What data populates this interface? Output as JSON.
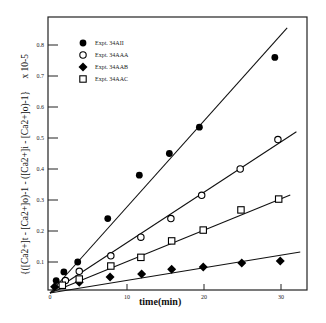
{
  "chart_data": {
    "type": "scatter",
    "title": "",
    "xlabel": "time(min)",
    "ylabel": "{([Ca2+]t - [Ca2+]o)-1 - ([Ca2+]i - [Ca2+]o)-1}",
    "ylabel_scale": "x 10-5",
    "xlim": [
      0,
      33.5
    ],
    "ylim": [
      0,
      0.88
    ],
    "x_ticks": [
      0,
      10,
      20,
      30
    ],
    "x_tick_labels": [
      "0",
      "10",
      "20",
      "30"
    ],
    "y_ticks": [
      0.1,
      0.2,
      0.3,
      0.4,
      0.5,
      0.6,
      0.7,
      0.8
    ],
    "y_tick_labels": [
      "0.1",
      "0.2",
      "0.3",
      "0.4",
      "0.5",
      "0.6",
      "0.7",
      "0.8"
    ],
    "grid": false,
    "legend_position": "top-left",
    "series": [
      {
        "name": "Expt. 34AII",
        "marker": "filled-circle",
        "x": [
          0.8,
          1.8,
          3.6,
          7.5,
          11.6,
          15.5,
          19.4,
          29.2
        ],
        "y": [
          0.04,
          0.068,
          0.1,
          0.24,
          0.38,
          0.45,
          0.535,
          0.76
        ],
        "fit_line": {
          "x": [
            0,
            30.8
          ],
          "y": [
            0,
            0.855
          ]
        }
      },
      {
        "name": "Expt. 34AAA",
        "marker": "open-circle",
        "x": [
          2.0,
          3.8,
          7.9,
          11.8,
          15.7,
          19.7,
          24.7,
          29.6
        ],
        "y": [
          0.04,
          0.07,
          0.12,
          0.18,
          0.24,
          0.315,
          0.4,
          0.495
        ],
        "fit_line": {
          "x": [
            0,
            32.0
          ],
          "y": [
            0,
            0.52
          ]
        }
      },
      {
        "name": "Expt. 34AAB",
        "marker": "filled-diamond",
        "x": [
          0.6,
          3.8,
          7.8,
          11.9,
          15.8,
          19.9,
          24.9,
          29.9
        ],
        "y": [
          0.02,
          0.035,
          0.052,
          0.061,
          0.077,
          0.084,
          0.097,
          0.103
        ],
        "fit_line": {
          "x": [
            0,
            32.5
          ],
          "y": [
            0,
            0.132
          ]
        }
      },
      {
        "name": "Expt. 34AAC",
        "marker": "open-square",
        "x": [
          1.6,
          3.8,
          7.9,
          11.8,
          15.8,
          19.9,
          24.8,
          29.7
        ],
        "y": [
          0.025,
          0.045,
          0.087,
          0.115,
          0.168,
          0.203,
          0.268,
          0.303
        ],
        "fit_line": {
          "x": [
            0,
            31.2
          ],
          "y": [
            0,
            0.316
          ]
        }
      }
    ]
  }
}
